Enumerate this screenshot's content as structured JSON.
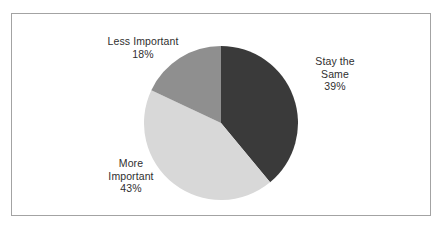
{
  "chart_data": {
    "type": "pie",
    "title": "",
    "subtitle": "",
    "xlabel": "",
    "ylabel": "",
    "legend_position": "none",
    "grid": false,
    "labels_position": "outside",
    "start_angle_deg": 0,
    "direction": "clockwise",
    "categories": [
      "Stay the Same",
      "More Important",
      "Less Important"
    ],
    "values": [
      39,
      43,
      18
    ],
    "value_unit": "%",
    "colors": [
      "#3a3a3a",
      "#d8d8d8",
      "#8f8f8f"
    ],
    "slices": [
      {
        "label": "Stay the Same",
        "label_line1": "Stay the",
        "label_line2": "Same",
        "value": 39,
        "value_text": "39%",
        "color": "#3a3a3a"
      },
      {
        "label": "More Important",
        "label_line1": "More",
        "label_line2": "Important",
        "value": 43,
        "value_text": "43%",
        "color": "#d8d8d8"
      },
      {
        "label": "Less Important",
        "label_line1": "Less Important",
        "label_line2": "",
        "value": 18,
        "value_text": "18%",
        "color": "#8f8f8f"
      }
    ]
  },
  "figure": {
    "border_color": "#a3a3a3",
    "background_color": "#ffffff",
    "text_color": "#2f2f2f"
  }
}
